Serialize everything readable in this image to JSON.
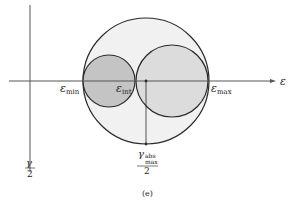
{
  "figure": {
    "caption": "(e)",
    "colors": {
      "stroke": "#2a2a2a",
      "outer_fill": "#f1f1f1",
      "left_fill": "#c4c4c4",
      "right_fill": "#dcdcdc",
      "axis": "#555555"
    }
  },
  "axes": {
    "horizontal_label": "ε",
    "vertical_label_numerator": "γ",
    "vertical_label_denominator": "2"
  },
  "labels": {
    "eps_min": {
      "symbol": "ε",
      "sub": "min"
    },
    "eps_int": {
      "symbol": "ε",
      "sub": "int"
    },
    "eps_max": {
      "symbol": "ε",
      "sub": "max"
    },
    "gamma_abs_max": {
      "symbol": "γ",
      "sub_top": "abs",
      "sub_bottom": "max",
      "denominator": "2"
    }
  },
  "circles": [
    {
      "name": "outer-mohr-circle",
      "cx": 146,
      "cy": 81,
      "r": 63
    },
    {
      "name": "left-mohr-circle",
      "cx": 109,
      "cy": 81,
      "r": 26
    },
    {
      "name": "right-mohr-circle",
      "cx": 172,
      "cy": 81,
      "r": 36
    }
  ]
}
